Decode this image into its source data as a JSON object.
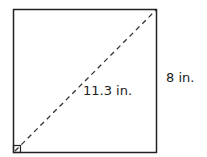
{
  "diagram": {
    "shape": "square",
    "labels": {
      "diagonal": "11.3 in.",
      "side": "8 in."
    },
    "colors": {
      "stroke": "#222222",
      "background": "#ffffff"
    }
  }
}
